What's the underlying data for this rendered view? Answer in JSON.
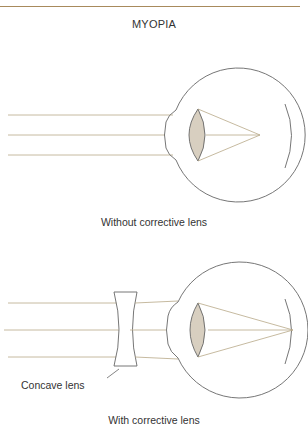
{
  "header": {
    "title": "MYOPIA"
  },
  "panels": [
    {
      "caption": "Without corrective lens"
    },
    {
      "caption": "With corrective lens",
      "lens_label": "Concave lens"
    }
  ],
  "colors": {
    "stroke": "#666666",
    "ray": "#b8a888",
    "lens_fill": "#d8cfc0",
    "rule": "#a88a5c"
  }
}
